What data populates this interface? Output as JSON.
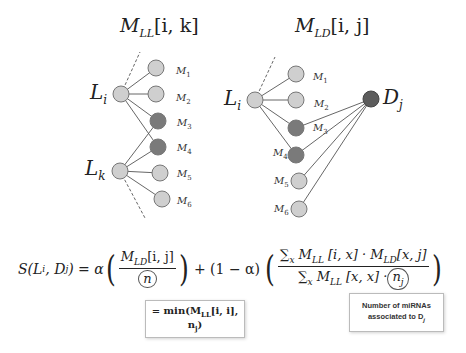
{
  "colors": {
    "light_node": "#cfcfcf",
    "dark_node": "#7a7a7a",
    "disease_node": "#5c5c5c",
    "edge": "#555555"
  },
  "left_graph": {
    "title": {
      "base": "M",
      "sub": "LL",
      "bracket": "[i, k]"
    },
    "lnc_nodes": [
      {
        "name": "L",
        "sub": "i"
      },
      {
        "name": "L",
        "sub": "k"
      }
    ],
    "mirna_nodes": [
      {
        "name": "M",
        "sub": "1",
        "shade": "light"
      },
      {
        "name": "M",
        "sub": "2",
        "shade": "light"
      },
      {
        "name": "M",
        "sub": "3",
        "shade": "dark"
      },
      {
        "name": "M",
        "sub": "4",
        "shade": "dark"
      },
      {
        "name": "M",
        "sub": "5",
        "shade": "light"
      },
      {
        "name": "M",
        "sub": "6",
        "shade": "light"
      }
    ]
  },
  "right_graph": {
    "title": {
      "base": "M",
      "sub": "LD",
      "bracket": "[i, j]"
    },
    "lnc_node": {
      "name": "L",
      "sub": "i"
    },
    "disease_node": {
      "name": "D",
      "sub": "j"
    },
    "mirna_nodes": [
      {
        "name": "M",
        "sub": "1",
        "shade": "light"
      },
      {
        "name": "M",
        "sub": "2",
        "shade": "light"
      },
      {
        "name": "M",
        "sub": "3",
        "shade": "dark"
      },
      {
        "name": "M",
        "sub": "4",
        "shade": "dark"
      },
      {
        "name": "M",
        "sub": "5",
        "shade": "light"
      },
      {
        "name": "M",
        "sub": "6",
        "shade": "light"
      }
    ]
  },
  "formula": {
    "lhs": "S(L",
    "lhs_sub_i": "i",
    "lhs_mid": ", D",
    "lhs_sub_j": "j",
    "lhs_end": ") = α",
    "term1_num_base": "M",
    "term1_num_sub": "LD",
    "term1_num_rest": "[i, j]",
    "term1_den": "n",
    "plus": "+ (1 − α)",
    "term2_num": "∑",
    "term2_num_x": "x",
    "term2_num_m1": " M",
    "term2_num_m1_sub": "LL",
    "term2_num_m1_rest": " [i, x] · M",
    "term2_num_m2_sub": "LD",
    "term2_num_m2_rest": "[x, j]",
    "term2_den_sum": "∑",
    "term2_den_x": "x",
    "term2_den_m": " M",
    "term2_den_m_sub": "LL",
    "term2_den_rest": " [x, x] ·",
    "term2_den_n": "n",
    "term2_den_n_sub": "j"
  },
  "annotations": {
    "min_box": {
      "prefix": "= min(M",
      "sub": "LL",
      "rest": "[i, i], n",
      "sub2": "j",
      "end": ")"
    },
    "note_box": {
      "line1": "Number of miRNAs",
      "line2": "associated to D",
      "sub": "j"
    }
  }
}
